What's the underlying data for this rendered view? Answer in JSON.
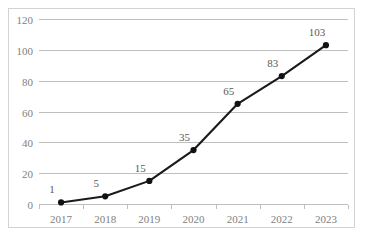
{
  "chart_data": {
    "type": "line",
    "title": "",
    "subtitle": "",
    "xlabel": "",
    "ylabel": "",
    "categories": [
      "2017",
      "2018",
      "2019",
      "2020",
      "2021",
      "2022",
      "2023"
    ],
    "values": [
      1,
      5,
      15,
      35,
      65,
      83,
      103
    ],
    "series": [
      {
        "name": "",
        "values": [
          1,
          5,
          15,
          35,
          65,
          83,
          103
        ]
      }
    ],
    "data_labels": [
      "1",
      "5",
      "15",
      "35",
      "65",
      "83",
      "103"
    ],
    "ylim": [
      0,
      120
    ],
    "yticks": [
      0,
      20,
      40,
      60,
      80,
      100,
      120
    ],
    "ytick_labels": [
      "0",
      "20",
      "40",
      "60",
      "80",
      "100",
      "120"
    ],
    "xtick_labels": [
      "2017",
      "2018",
      "2019",
      "2020",
      "2021",
      "2022",
      "2023"
    ],
    "grid": true,
    "grid_axis": "y",
    "legend": false,
    "legend_position": "none",
    "markers": true,
    "marker_shape": "circle",
    "colors": {
      "series_line": "#1a1a1a",
      "marker": "#111111",
      "gridline": "#bfbfbf",
      "axis": "#bfbfbf",
      "tick_label": "#808080",
      "data_label": "#595959",
      "border": "#d3d3d3",
      "background": "#ffffff"
    }
  }
}
